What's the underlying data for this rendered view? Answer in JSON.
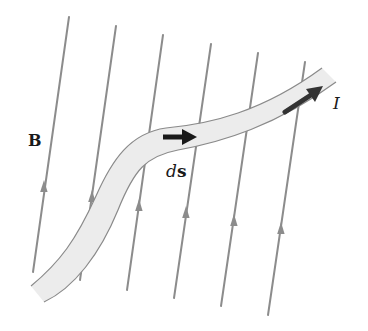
{
  "diagram": {
    "labels": {
      "field": "B",
      "element_d": "d",
      "element_s": "s",
      "current": "I"
    },
    "colors": {
      "field_line": "#8c8c8c",
      "wire_fill": "#ececec",
      "wire_edge": "#8a8a8a",
      "arrow": "#1a1a1a",
      "text": "#1a1a1a"
    },
    "field_lines": [
      {
        "x1": 69,
        "y1": 17,
        "x2": 33,
        "y2": 272,
        "arrow_at": [
          44,
          185
        ]
      },
      {
        "x1": 116,
        "y1": 26,
        "x2": 80,
        "y2": 280,
        "arrow_at": [
          92,
          195
        ]
      },
      {
        "x1": 163,
        "y1": 35,
        "x2": 127,
        "y2": 290,
        "arrow_at": [
          139,
          205
        ]
      },
      {
        "x1": 211,
        "y1": 44,
        "x2": 174,
        "y2": 298,
        "arrow_at": [
          186,
          212
        ]
      },
      {
        "x1": 258,
        "y1": 53,
        "x2": 221,
        "y2": 306,
        "arrow_at": [
          234,
          220
        ]
      },
      {
        "x1": 305,
        "y1": 62,
        "x2": 268,
        "y2": 315,
        "arrow_at": [
          281,
          228
        ]
      }
    ],
    "vectors": [
      {
        "name": "ds",
        "direction": "right"
      },
      {
        "name": "I",
        "direction": "up-right"
      }
    ]
  }
}
